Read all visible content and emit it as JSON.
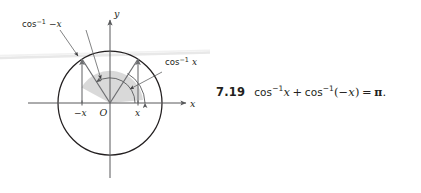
{
  "figure": {
    "name": "unit-circle-arccos-diagram",
    "axes": {
      "x_axis_label": "x",
      "y_axis_label": "y",
      "origin_label": "O"
    },
    "tick_labels": {
      "negative_x": "−x",
      "positive_x": "x"
    },
    "annotations": {
      "left_angle": {
        "fn": "cos",
        "exponent": "−1",
        "arg": "−x"
      },
      "right_angle": {
        "fn": "cos",
        "exponent": "−1",
        "arg": "x"
      }
    },
    "colors": {
      "circle_stroke": "#231f20",
      "axis_stroke": "#58595b",
      "ray_stroke": "#6d6e71",
      "arc_stroke": "#58595b",
      "shade_fill": "#d9d9d9",
      "artifact": "#e6e6e6",
      "text": "#231f20"
    },
    "geometry": {
      "center_x": 110,
      "center_y": 103,
      "radius": 52,
      "point_x_offset": 28
    }
  },
  "caption": {
    "number": "7.19",
    "formula_plain": "cos−1x + cos−1(−x) = π.",
    "fn": "cos",
    "exponent": "−1",
    "arg_first": "x",
    "plus": "+",
    "arg_second_open": "(",
    "arg_second": "−x",
    "arg_second_close": ")",
    "equals": "=",
    "pi": "π",
    "period": "."
  }
}
